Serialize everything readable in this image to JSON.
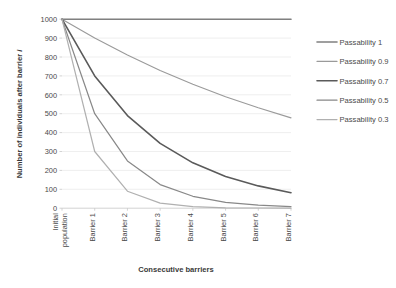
{
  "chart_data": {
    "type": "line",
    "title": "",
    "xlabel": "Consecutive barriers",
    "ylabel": "Number of individuals after barrier i",
    "ylabel_plain": "Number of individuals after barrier",
    "ylabel_italic": "i",
    "categories": [
      "Initial population",
      "Barrier 1",
      "Barrier 2",
      "Barrier 3",
      "Barrier 4",
      "Barrier 5",
      "Barrier 6",
      "Barrier 7"
    ],
    "x": [
      0,
      1,
      2,
      3,
      4,
      5,
      6,
      7
    ],
    "ylim": [
      0,
      1000
    ],
    "yticks": [
      0,
      100,
      200,
      300,
      400,
      500,
      600,
      700,
      800,
      900,
      1000
    ],
    "ytick_labels": [
      "0",
      "100",
      "200",
      "300",
      "400",
      "500",
      "600",
      "700",
      "800",
      "900",
      "1000"
    ],
    "grid": "horizontal",
    "legend_position": "right",
    "series": [
      {
        "name": "Passability 1",
        "passability": 1,
        "color": "#808080",
        "width": 1.6,
        "values": [
          1000,
          1000,
          1000,
          1000,
          1000,
          1000,
          1000,
          1000
        ]
      },
      {
        "name": "Passability 0.9",
        "passability": 0.9,
        "color": "#9a9a9a",
        "width": 1.1,
        "values": [
          1000,
          900,
          810,
          729,
          656,
          590,
          531,
          478
        ]
      },
      {
        "name": "Passability 0.7",
        "passability": 0.7,
        "color": "#5a5a5a",
        "width": 1.6,
        "values": [
          1000,
          700,
          490,
          343,
          240,
          168,
          118,
          82
        ]
      },
      {
        "name": "Passability 0.5",
        "passability": 0.5,
        "color": "#888888",
        "width": 1.2,
        "values": [
          1000,
          500,
          250,
          125,
          63,
          31,
          16,
          8
        ]
      },
      {
        "name": "Passability 0.3",
        "passability": 0.3,
        "color": "#b0b0b0",
        "width": 1.2,
        "values": [
          1000,
          300,
          90,
          27,
          8,
          2,
          1,
          0
        ]
      }
    ]
  },
  "legend": {
    "items": [
      {
        "label": "Passability 1"
      },
      {
        "label": "Passability 0.9"
      },
      {
        "label": "Passability 0.7"
      },
      {
        "label": "Passability 0.5"
      },
      {
        "label": "Passability 0.3"
      }
    ]
  },
  "colors": {
    "gridline": "#e8e8e8",
    "axis": "#c8c8c8",
    "text": "#4a4a4a",
    "background": "#ffffff"
  }
}
